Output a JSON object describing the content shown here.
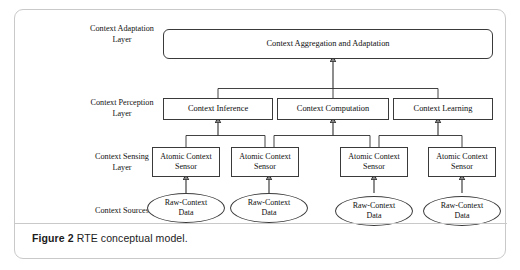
{
  "figure": {
    "caption_label": "Figure 2",
    "caption_text": " RTE conceptual model."
  },
  "layers": [
    {
      "id": "adaptation",
      "label": "Context Adaptation\nLayer"
    },
    {
      "id": "perception",
      "label": "Context Perception\nLayer"
    },
    {
      "id": "sensing",
      "label": "Context Sensing\nLayer"
    },
    {
      "id": "sources",
      "label": "Context Sources"
    }
  ],
  "nodes": {
    "adaptation": {
      "label": "Context Aggregation and Adaptation"
    },
    "perception": [
      {
        "label": "Context Inference"
      },
      {
        "label": "Context Computation"
      },
      {
        "label": "Context Learning"
      }
    ],
    "sensors": [
      {
        "label": "Atomic Context\nSensor"
      },
      {
        "label": "Atomic Context\nSensor"
      },
      {
        "label": "Atomic Context\nSensor"
      },
      {
        "label": "Atomic Context\nSensor"
      }
    ],
    "sources": [
      {
        "label": "Raw-Context\nData"
      },
      {
        "label": "Raw-Context\nData"
      },
      {
        "label": "Raw-Context\nData"
      },
      {
        "label": "Raw-Context\nData"
      }
    ]
  },
  "style": {
    "frame_border": "#c9c9c9",
    "node_border": "#3a3a3a",
    "wire_color": "#2e2e2e",
    "text_color": "#0d0d0d",
    "background": "#ffffff"
  }
}
